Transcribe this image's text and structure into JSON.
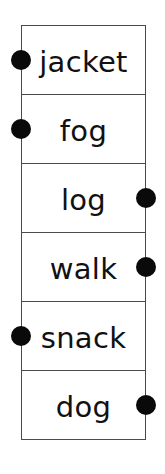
{
  "diagram": {
    "type": "word-column-matching",
    "dot_color": "#0a0a0a",
    "border_color": "#4a4a4a",
    "rows": [
      {
        "word": "jacket",
        "dot_side": "left"
      },
      {
        "word": "fog",
        "dot_side": "left"
      },
      {
        "word": "log",
        "dot_side": "right"
      },
      {
        "word": "walk",
        "dot_side": "right"
      },
      {
        "word": "snack",
        "dot_side": "left"
      },
      {
        "word": "dog",
        "dot_side": "right"
      }
    ]
  }
}
